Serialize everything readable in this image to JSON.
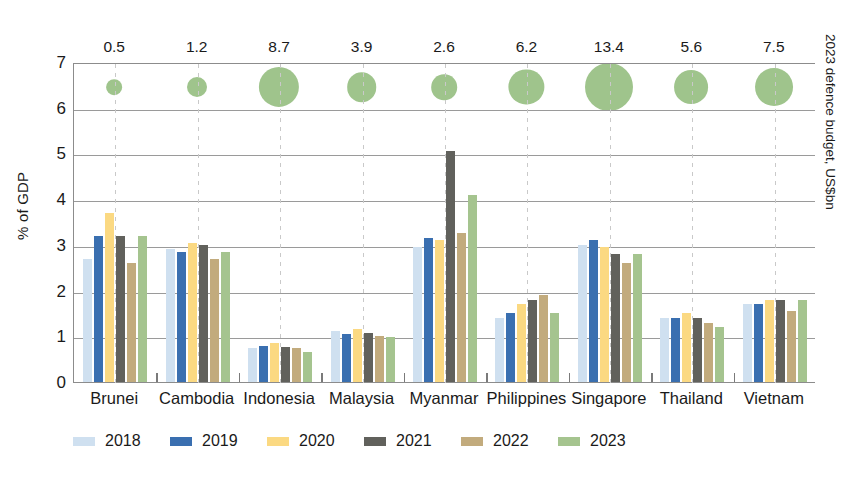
{
  "chart_data": {
    "type": "bar",
    "title": "",
    "ylabel": "% of GDP",
    "xlabel": "",
    "ylim": [
      0,
      7
    ],
    "y_ticks": [
      "0",
      "1",
      "2",
      "3",
      "4",
      "5",
      "6",
      "7"
    ],
    "grid": true,
    "legend_position": "bottom",
    "categories": [
      "Brunei",
      "Cambodia",
      "Indonesia",
      "Malaysia",
      "Myanmar",
      "Philippines",
      "Singapore",
      "Thailand",
      "Vietnam"
    ],
    "series": [
      {
        "name": "2018",
        "color": "#cfe0f0",
        "values": [
          2.7,
          2.9,
          0.75,
          1.12,
          2.95,
          1.4,
          3.0,
          1.4,
          1.7
        ]
      },
      {
        "name": "2019",
        "color": "#3a6fb0",
        "values": [
          3.2,
          2.85,
          0.78,
          1.05,
          3.15,
          1.5,
          3.1,
          1.4,
          1.7
        ]
      },
      {
        "name": "2020",
        "color": "#fbd982",
        "values": [
          3.7,
          3.05,
          0.85,
          1.15,
          3.1,
          1.7,
          2.95,
          1.5,
          1.8
        ]
      },
      {
        "name": "2021",
        "color": "#61615c",
        "values": [
          3.2,
          3.0,
          0.77,
          1.08,
          5.05,
          1.8,
          2.8,
          1.4,
          1.8
        ]
      },
      {
        "name": "2022",
        "color": "#c2ab7d",
        "values": [
          2.6,
          2.7,
          0.75,
          1.0,
          3.25,
          1.9,
          2.6,
          1.3,
          1.55
        ]
      },
      {
        "name": "2023",
        "color": "#a5c48f",
        "values": [
          3.2,
          2.85,
          0.65,
          0.98,
          4.1,
          1.5,
          2.8,
          1.2,
          1.8
        ]
      }
    ],
    "secondary_axis": {
      "label": "2023 defence budget, US$bn",
      "type": "bubble",
      "unit": "US$bn",
      "values": [
        0.5,
        1.2,
        8.7,
        3.9,
        2.6,
        6.2,
        13.4,
        5.6,
        7.5
      ],
      "value_labels": [
        "0.5",
        "1.2",
        "8.7",
        "3.9",
        "2.6",
        "6.2",
        "13.4",
        "5.6",
        "7.5"
      ],
      "bubble_color": "#9fc48c"
    }
  }
}
